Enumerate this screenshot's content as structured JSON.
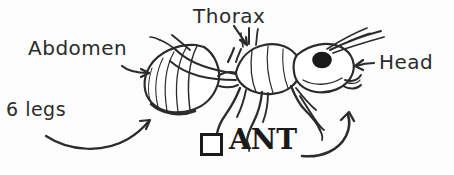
{
  "figure": {
    "subject": "ant",
    "style": "hand-drawn black ink sketch on white paper",
    "width": 454,
    "height": 175,
    "background_color": "#fdfdfd",
    "ink_color": "#2b2b2b"
  },
  "labels": {
    "abdomen": "Abdomen",
    "thorax": "Thorax",
    "head": "Head",
    "legs": "6 legs",
    "ant": "ANT"
  },
  "checkbox": {
    "checked": false,
    "label": "ANT"
  },
  "annotations": [
    {
      "name": "abdomen",
      "text": "Abdomen",
      "arrow": "straight-right",
      "points_to": "abdomen-segment"
    },
    {
      "name": "thorax",
      "text": "Thorax",
      "arrow": "straight-down",
      "points_to": "thorax-segment"
    },
    {
      "name": "head",
      "text": "Head",
      "arrow": "straight-left",
      "points_to": "head-segment"
    },
    {
      "name": "legs",
      "text": "6 legs",
      "arrow": "curved-up-right",
      "points_to": "legs"
    },
    {
      "name": "ant",
      "text": "ANT",
      "arrow": "curved-up-left",
      "points_to": "hind-leg"
    }
  ]
}
